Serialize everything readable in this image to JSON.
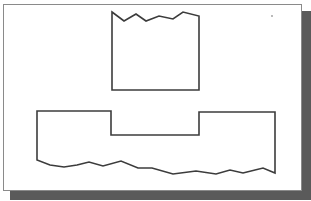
{
  "figure": {
    "colors": {
      "background": "#ffffff",
      "panel_border": "#8a8a8a",
      "shadow": "#5a5a5a",
      "line": "#3c3c3c"
    },
    "shapes": [
      {
        "name": "upper-part",
        "type": "rectangle-with-break-line",
        "break_edge": "top",
        "points": "112,12 124,21 136,14 146,21 159,16 173,19 183,12 199,16 199,90 112,90"
      },
      {
        "name": "lower-part",
        "type": "notched-block-with-break-line",
        "break_edge": "bottom",
        "points": "37,160 37,111 111,111 111,135 199,135 199,112 275,112 275,173 263,168 243,173 230,170 216,174 196,171 173,174 152,168 138,168 121,161 103,166 89,162 77,165 64,167 50,165"
      }
    ]
  }
}
